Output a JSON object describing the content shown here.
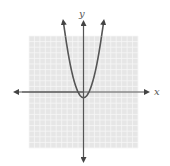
{
  "chart_data": {
    "type": "line",
    "title": "",
    "xlabel": "x",
    "ylabel": "y",
    "xlim": [
      -10,
      10
    ],
    "ylim": [
      -10,
      10
    ],
    "grid": true,
    "grid_step": 1,
    "series": [
      {
        "name": "parabola",
        "equation": "y = x^2 - 1",
        "x": [
          -3.3,
          -3,
          -2,
          -1,
          0,
          1,
          2,
          3,
          3.3
        ],
        "values": [
          9.89,
          8,
          3,
          0,
          -1,
          0,
          3,
          8,
          9.89
        ],
        "vertex": [
          0,
          -1
        ],
        "arrows": "both ends upward"
      }
    ]
  },
  "labels": {
    "x_axis": "x",
    "y_axis": "y"
  },
  "colors": {
    "grid_bg": "#e6e6e6",
    "grid_line": "#f6f6f6",
    "axis": "#555555",
    "curve": "#555555",
    "label": "#555555"
  }
}
